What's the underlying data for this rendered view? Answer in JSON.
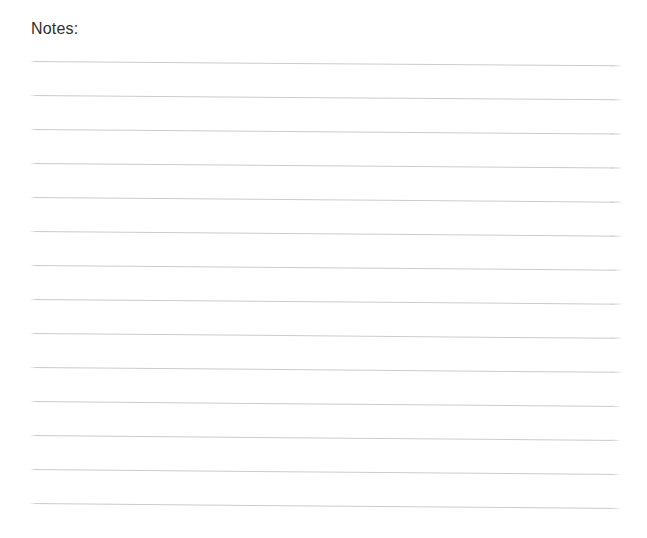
{
  "page": {
    "width": 647,
    "height": 538,
    "background_color": "#ffffff",
    "kind": "notes-page"
  },
  "notes": {
    "label": "Notes:",
    "label_color": "#2f2f2f",
    "label_x": 31,
    "label_y": 19,
    "label_font_size": 16
  },
  "ruled_lines": {
    "count": 14,
    "color": "#c9c9c9",
    "thickness": 1,
    "left_x": 30,
    "right_x": 621,
    "first_y": 61,
    "spacing": 34,
    "tilt_degrees": 0.45,
    "lines": [
      {
        "index": 1,
        "y": 61,
        "x1": 30,
        "x2": 621,
        "tilt": 0.42
      },
      {
        "index": 2,
        "y": 95,
        "x1": 30,
        "x2": 621,
        "tilt": 0.42
      },
      {
        "index": 3,
        "y": 129,
        "x1": 30,
        "x2": 621,
        "tilt": 0.44
      },
      {
        "index": 4,
        "y": 163,
        "x1": 30,
        "x2": 621,
        "tilt": 0.44
      },
      {
        "index": 5,
        "y": 197,
        "x1": 30,
        "x2": 621,
        "tilt": 0.45
      },
      {
        "index": 6,
        "y": 231,
        "x1": 30,
        "x2": 621,
        "tilt": 0.45
      },
      {
        "index": 7,
        "y": 265,
        "x1": 30,
        "x2": 621,
        "tilt": 0.46
      },
      {
        "index": 8,
        "y": 299,
        "x1": 30,
        "x2": 621,
        "tilt": 0.46
      },
      {
        "index": 9,
        "y": 333,
        "x1": 30,
        "x2": 621,
        "tilt": 0.47
      },
      {
        "index": 10,
        "y": 367,
        "x1": 30,
        "x2": 621,
        "tilt": 0.47
      },
      {
        "index": 11,
        "y": 401,
        "x1": 30,
        "x2": 621,
        "tilt": 0.48
      },
      {
        "index": 12,
        "y": 435,
        "x1": 30,
        "x2": 621,
        "tilt": 0.48
      },
      {
        "index": 13,
        "y": 469,
        "x1": 30,
        "x2": 621,
        "tilt": 0.49
      },
      {
        "index": 14,
        "y": 503,
        "x1": 30,
        "x2": 621,
        "tilt": 0.49
      }
    ]
  }
}
